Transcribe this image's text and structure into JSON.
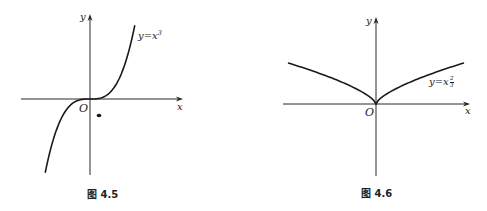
{
  "chart_data": [
    {
      "type": "line",
      "title": "",
      "caption": "图 4.5",
      "series": [
        {
          "name": "y=x^3",
          "function": "x^3",
          "x_range": [
            -1.6,
            1.6
          ]
        }
      ],
      "curve_label": "y=x³",
      "xlabel": "x",
      "ylabel": "y",
      "origin_label": "O",
      "grid": false,
      "annotations": [
        "stray dot below-right of origin"
      ]
    },
    {
      "type": "line",
      "title": "",
      "caption": "图 4.6",
      "series": [
        {
          "name": "y=x^(2/3)",
          "function": "x^(2/3)",
          "x_range": [
            -2.7,
            2.7
          ]
        }
      ],
      "curve_label": "y=x^(2/3)",
      "xlabel": "x",
      "ylabel": "y",
      "origin_label": "O",
      "grid": false
    }
  ],
  "fig1": {
    "caption": "图 4.5",
    "ylabel": "y",
    "xlabel": "x",
    "origin": "O",
    "curve_label_base": "y=x",
    "curve_label_exp": "3",
    "geom": {
      "ox": 90,
      "oy": 99,
      "xmin": 21,
      "xmax": 183,
      "ymin": 14,
      "ymax": 175,
      "sx": 28,
      "sy": 18,
      "tmin": -1.6,
      "tmax": 1.6
    }
  },
  "fig2": {
    "caption": "图 4.6",
    "ylabel": "y",
    "xlabel": "x",
    "origin": "O",
    "curve_label_base": "y=x",
    "curve_label_num": "2",
    "curve_label_den": "3",
    "geom": {
      "ox": 133,
      "oy": 104,
      "xmin": 40,
      "xmax": 227,
      "ymin": 17,
      "ymax": 176,
      "sx": 32.6,
      "sy": 21.2,
      "tmin": -2.7,
      "tmax": 2.7
    }
  }
}
